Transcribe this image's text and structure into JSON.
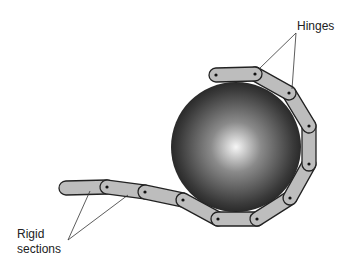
{
  "diagram": {
    "type": "chain wrapped around sphere",
    "labels": {
      "hinges": "Hinges",
      "rigid_line1": "Rigid",
      "rigid_line2": "sections"
    },
    "sphere": {
      "cx": 236,
      "cy": 147,
      "r": 65,
      "highlight": "#f4f4f4",
      "shadow": "#1e1e1e"
    },
    "section_fill": "#bdbdbd",
    "section_stroke": "#222222",
    "chain_points": [
      [
        216,
        75
      ],
      [
        255,
        74
      ],
      [
        289,
        93
      ],
      [
        309,
        126
      ],
      [
        309,
        164
      ],
      [
        290,
        198
      ],
      [
        257,
        219
      ],
      [
        218,
        219
      ],
      [
        183,
        200
      ],
      [
        145,
        192
      ],
      [
        107,
        187
      ],
      [
        66,
        188
      ]
    ]
  }
}
